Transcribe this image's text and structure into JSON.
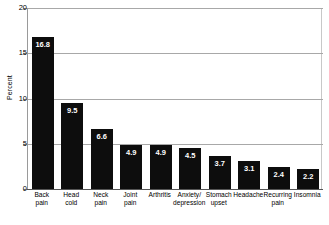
{
  "chart_data": {
    "type": "bar",
    "title": "",
    "xlabel": "",
    "ylabel": "Percent",
    "ylim": [
      0,
      20
    ],
    "yticks": [
      0,
      5,
      10,
      15,
      20
    ],
    "grid": true,
    "legend": "none",
    "bar_color": "#0d0d0d",
    "value_label_color": "#ffffff",
    "gridline_color": "#a8a8a8",
    "categories": [
      "Back pain",
      "Head cold",
      "Neck pain",
      "Joint pain",
      "Arthritis",
      "Anxiety/ depression",
      "Stomach upset",
      "Headache",
      "Recurring pain",
      "Insomnia"
    ],
    "values": [
      16.8,
      9.5,
      6.6,
      4.9,
      4.9,
      4.5,
      3.7,
      3.1,
      2.4,
      2.2
    ],
    "value_labels": [
      "16.8",
      "9.5",
      "6.6",
      "4.9",
      "4.9",
      "4.5",
      "3.7",
      "3.1",
      "2.4",
      "2.2"
    ]
  },
  "axis": {
    "y_title": "Percent",
    "y_tick_labels": [
      "20",
      "15",
      "10",
      "5",
      "0"
    ]
  },
  "x_labels": [
    {
      "line1": "Back",
      "line2": "pain"
    },
    {
      "line1": "Head",
      "line2": "cold"
    },
    {
      "line1": "Neck",
      "line2": "pain"
    },
    {
      "line1": "Joint",
      "line2": "pain"
    },
    {
      "line1": "Arthritis",
      "line2": ""
    },
    {
      "line1": "Anxiety/",
      "line2": "depression"
    },
    {
      "line1": "Stomach",
      "line2": "upset"
    },
    {
      "line1": "Headache",
      "line2": ""
    },
    {
      "line1": "Recurring",
      "line2": "pain"
    },
    {
      "line1": "Insomnia",
      "line2": ""
    }
  ],
  "footnote": ""
}
